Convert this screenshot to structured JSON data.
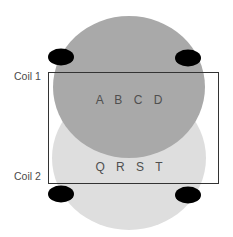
{
  "diagram": {
    "coils": [
      {
        "label": "Coil 1"
      },
      {
        "label": "Coil 2"
      }
    ],
    "regions": [
      {
        "text": "A B C D",
        "fill": "#a9a9a9"
      },
      {
        "text": "Q R S T",
        "fill": "#dedede"
      }
    ],
    "rectangle": {
      "stroke": "#333333"
    },
    "markers": {
      "fill": "#000000",
      "count": 4
    }
  }
}
